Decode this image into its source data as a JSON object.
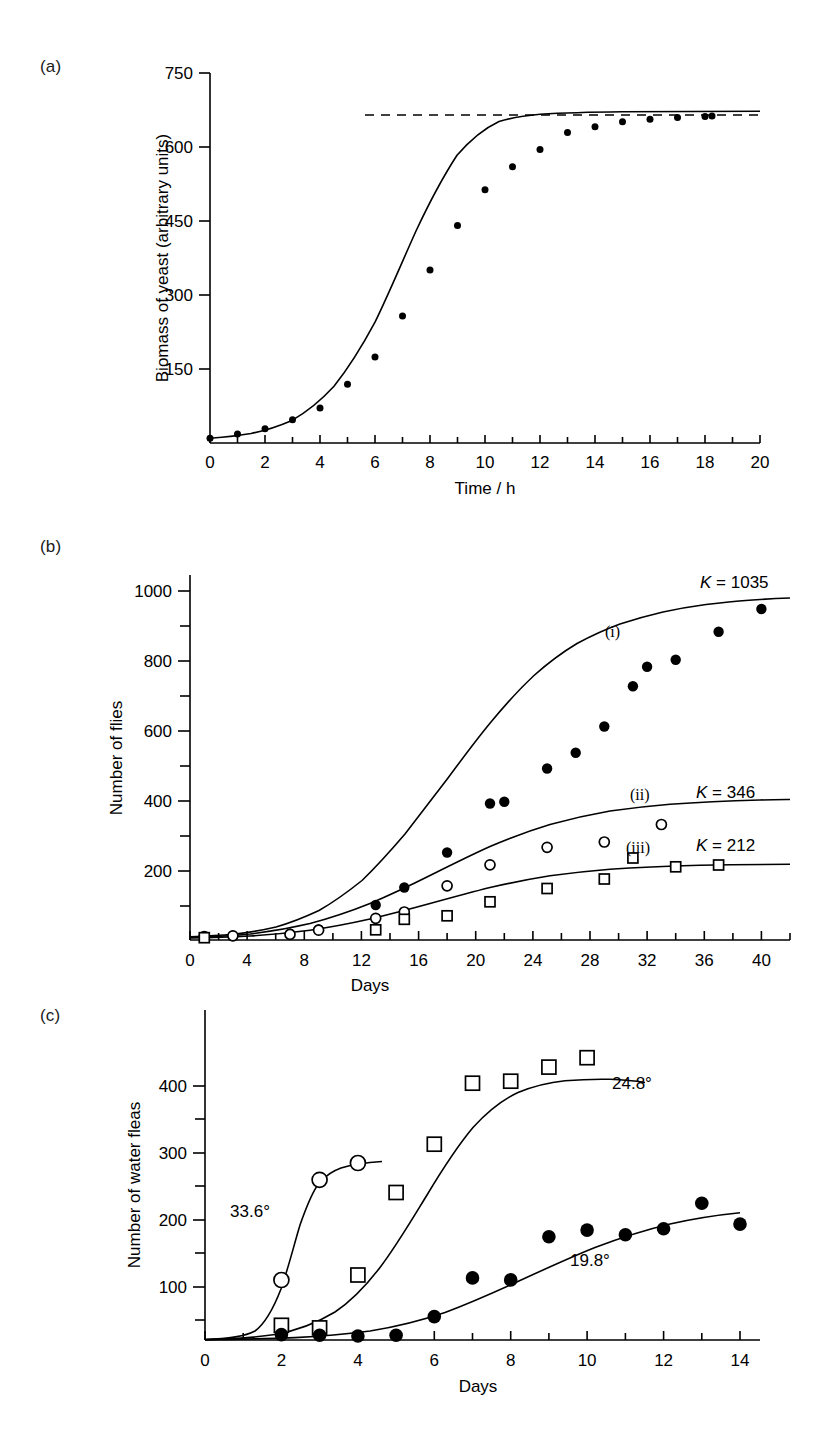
{
  "figure": {
    "background": "#ffffff",
    "ink": "#000000",
    "panels": [
      {
        "id": "a",
        "label": "(a)"
      },
      {
        "id": "b",
        "label": "(b)"
      },
      {
        "id": "c",
        "label": "(c)"
      }
    ]
  },
  "chart_data": [
    {
      "id": "a",
      "panel_label": "(a)",
      "type": "scatter",
      "title": "",
      "xlabel": "Time / h",
      "ylabel": "Biomass of yeast (arbitrary units)",
      "xlim": [
        0,
        20
      ],
      "ylim": [
        0,
        750
      ],
      "xticks": [
        0,
        2,
        4,
        6,
        8,
        10,
        12,
        14,
        16,
        18,
        20
      ],
      "xtick_labels": [
        "0",
        "2",
        "4",
        "6",
        "8",
        "10",
        "12",
        "14",
        "16",
        "18",
        "20"
      ],
      "xticks_minor": [
        1,
        3,
        5,
        7,
        9,
        11,
        13,
        15,
        17,
        19
      ],
      "yticks": [
        150,
        300,
        450,
        600,
        750
      ],
      "ytick_labels": [
        "150",
        "300",
        "450",
        "600",
        "750"
      ],
      "grid": false,
      "legend": "none",
      "annotations": [
        {
          "text": "",
          "kind": "asymptote-dashed-line",
          "y": 665,
          "x_start": 5.6,
          "x_end": 20
        }
      ],
      "series": [
        {
          "name": "yeast biomass",
          "marker": "filled-circle",
          "x": [
            0,
            1,
            2,
            3,
            4,
            5,
            6,
            7,
            8,
            9,
            10,
            11,
            12,
            13,
            14,
            15,
            16,
            17,
            18,
            19
          ],
          "y": [
            9.6,
            18.3,
            29.0,
            47.2,
            71.1,
            119.1,
            174.6,
            257.3,
            350.7,
            441.0,
            513.3,
            559.7,
            594.8,
            629.4,
            640.8,
            651.1,
            655.9,
            659.6,
            661.8,
            663.0
          ]
        },
        {
          "name": "fitted logistic curve",
          "marker": "none",
          "style": "solid-line",
          "K": 665,
          "r": 0.53,
          "t_midpoint": 7.8
        }
      ]
    },
    {
      "id": "b",
      "panel_label": "(b)",
      "type": "scatter",
      "title": "",
      "xlabel": "Days",
      "ylabel": "Number of flies",
      "xlim": [
        0,
        42
      ],
      "ylim": [
        0,
        1080
      ],
      "xticks": [
        0,
        4,
        8,
        12,
        16,
        20,
        24,
        28,
        32,
        36,
        40
      ],
      "xtick_labels": [
        "0",
        "4",
        "8",
        "12",
        "16",
        "20",
        "24",
        "28",
        "32",
        "36",
        "40"
      ],
      "xticks_minor": [
        2,
        6,
        10,
        14,
        18,
        22,
        26,
        30,
        34,
        38,
        42
      ],
      "yticks": [
        200,
        400,
        600,
        800,
        1000
      ],
      "ytick_labels": [
        "200",
        "400",
        "600",
        "800",
        "1000"
      ],
      "yticks_minor": [
        100,
        300,
        500,
        700,
        900
      ],
      "grid": false,
      "legend": "inline-annotations",
      "annotations": [
        {
          "text": "K = 1035",
          "series": "i",
          "x": 37.0,
          "y": 1030
        },
        {
          "text": "(i)",
          "series": "i",
          "x": 30.2,
          "y": 860
        },
        {
          "text": "K = 346",
          "series": "ii",
          "x": 36.8,
          "y": 400
        },
        {
          "text": "(ii)",
          "series": "ii",
          "x": 31.8,
          "y": 398
        },
        {
          "text": "K = 212",
          "series": "iii",
          "x": 36.8,
          "y": 250
        },
        {
          "text": "(iii)",
          "series": "iii",
          "x": 31.8,
          "y": 248
        }
      ],
      "series": [
        {
          "name": "(i)",
          "K": 1035,
          "K_label": "K = 1035",
          "marker": "filled-circle",
          "x": [
            1,
            3,
            7,
            9,
            13,
            15,
            18,
            21,
            22,
            25,
            27,
            29,
            31,
            32,
            34,
            37,
            40
          ],
          "y": [
            10,
            12,
            18,
            30,
            100,
            150,
            250,
            390,
            395,
            490,
            535,
            610,
            725,
            780,
            800,
            880,
            945
          ]
        },
        {
          "name": "(ii)",
          "K": 346,
          "K_label": "K = 346",
          "marker": "open-circle",
          "x": [
            1,
            3,
            7,
            9,
            13,
            15,
            18,
            21,
            25,
            29,
            33
          ],
          "y": [
            10,
            12,
            16,
            28,
            62,
            80,
            155,
            215,
            265,
            280,
            330
          ]
        },
        {
          "name": "(iii)",
          "K": 212,
          "K_label": "K = 212",
          "marker": "open-square",
          "x": [
            1,
            13,
            15,
            18,
            21,
            25,
            29,
            31,
            34,
            37
          ],
          "y": [
            8,
            30,
            60,
            70,
            110,
            148,
            175,
            235,
            210,
            215
          ]
        }
      ]
    },
    {
      "id": "c",
      "panel_label": "(c)",
      "type": "scatter",
      "title": "",
      "xlabel": "Days",
      "ylabel": "Number of water fleas",
      "xlim": [
        0,
        14.6
      ],
      "ylim": [
        0,
        445
      ],
      "xticks": [
        0,
        2,
        4,
        6,
        8,
        10,
        12,
        14
      ],
      "xtick_labels": [
        "0",
        "2",
        "4",
        "6",
        "8",
        "10",
        "12",
        "14"
      ],
      "xticks_minor": [
        1,
        3,
        5,
        7,
        9,
        11,
        13
      ],
      "yticks": [
        100,
        200,
        300,
        400
      ],
      "ytick_labels": [
        "100",
        "200",
        "300",
        "400"
      ],
      "yticks_minor": [
        50,
        150,
        250,
        350
      ],
      "grid": false,
      "legend": "inline-annotations",
      "annotations": [
        {
          "text": "33.6°",
          "series": "33.6",
          "x": 1.55,
          "y": 222
        },
        {
          "text": "24.8°",
          "series": "24.8",
          "x": 10.65,
          "y": 390
        },
        {
          "text": "19.8°",
          "series": "19.8",
          "x": 9.6,
          "y": 128
        }
      ],
      "series": [
        {
          "name": "33.6°",
          "temperature_label": "33.6°",
          "marker": "open-circle",
          "x": [
            2,
            3,
            4
          ],
          "y": [
            90,
            239,
            264
          ]
        },
        {
          "name": "24.8°",
          "temperature_label": "24.8°",
          "marker": "open-square",
          "x": [
            2,
            3,
            4,
            5,
            6,
            7,
            8,
            9,
            10
          ],
          "y": [
            22,
            18,
            97,
            220,
            292,
            383,
            386,
            407,
            421
          ]
        },
        {
          "name": "19.8°",
          "temperature_label": "19.8°",
          "marker": "filled-circle",
          "x": [
            2,
            3,
            4,
            5,
            6,
            7,
            8,
            9,
            10,
            11,
            12,
            13,
            14
          ],
          "y": [
            8,
            7,
            6,
            7,
            34,
            92,
            89,
            153,
            163,
            156,
            165,
            203,
            172
          ]
        }
      ]
    }
  ]
}
